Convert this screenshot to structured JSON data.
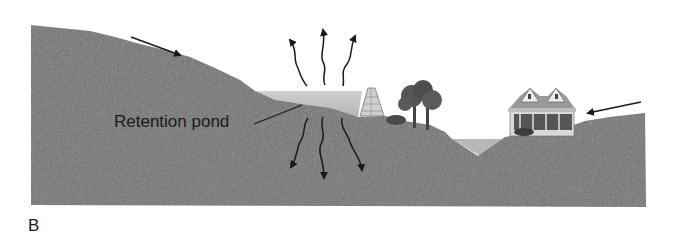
{
  "figure": {
    "panel_label": "B",
    "pond_label": "Retention pond",
    "colors": {
      "ground": "#6f6f6f",
      "water": "#c4c4c4",
      "arrow": "#1a1a1a",
      "background": "#ffffff"
    },
    "elements": {
      "runoff_arrows": 2,
      "evaporation_arrows": 3,
      "infiltration_arrows": 3,
      "features": [
        "sloped-ground",
        "retention-pond",
        "dam",
        "trees",
        "drainage-ditch",
        "house"
      ]
    }
  }
}
